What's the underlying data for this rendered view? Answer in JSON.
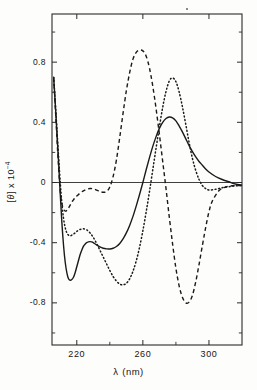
{
  "figure": {
    "kind": "scientific-plot",
    "background": "#fdfdfc",
    "ink": "#1a1a1a"
  },
  "axes": {
    "x": {
      "label_symbol": "λ",
      "label_unit": "(nm)",
      "label_full": "λ (nm)",
      "ticks": [
        220,
        260,
        300
      ],
      "tick_labels": [
        "220",
        "260",
        "300"
      ],
      "range": [
        205,
        320
      ],
      "minor_ticks": [
        240,
        280
      ]
    },
    "y": {
      "label_bracket_open": "[",
      "label_symbol": "θ",
      "label_bracket_close": "]",
      "label_mult": " x 10",
      "label_exp": "-4",
      "label_full": "[θ] x 10⁻⁴",
      "ticks": [
        0.8,
        0.4,
        0,
        -0.4,
        -0.8
      ],
      "tick_labels": [
        "0.8",
        "0.4",
        "0",
        "-0.4",
        "-0.8"
      ],
      "range": [
        -1.08,
        1.12
      ],
      "minor_ticks": [
        1.0,
        0.6,
        0.2,
        -0.2,
        -0.6,
        -1.0
      ]
    },
    "frame": {
      "left": 52,
      "right": 242,
      "top": 14,
      "bottom": 345
    },
    "zero_line": true
  },
  "chart_data": {
    "type": "line",
    "title": "",
    "xlabel": "λ (nm)",
    "ylabel": "[θ] x 10⁻⁴",
    "xlim": [
      205,
      320
    ],
    "ylim": [
      -1.08,
      1.12
    ],
    "grid": false,
    "legend": "none",
    "x_unit": "nm",
    "y_unit": "deg cm2 dmol-1 (x 10^-4)",
    "series": [
      {
        "name": "solid-curve",
        "style": "solid",
        "color": "#1a1a1a",
        "width": 1.4,
        "x": [
          206,
          207,
          208,
          209,
          210,
          211,
          212,
          213,
          214,
          215,
          216,
          217,
          218,
          219,
          220,
          221,
          222,
          223,
          224,
          225,
          226,
          227,
          228,
          229,
          230,
          232,
          234,
          236,
          238,
          240,
          242,
          244,
          246,
          248,
          250,
          252,
          254,
          256,
          258,
          260,
          262,
          264,
          266,
          268,
          270,
          272,
          274,
          276,
          278,
          280,
          282,
          284,
          286,
          288,
          290,
          292,
          294,
          296,
          298,
          300,
          304,
          308,
          312,
          316,
          320
        ],
        "y": [
          0.7,
          0.52,
          0.33,
          0.13,
          -0.08,
          -0.27,
          -0.42,
          -0.53,
          -0.6,
          -0.64,
          -0.65,
          -0.645,
          -0.63,
          -0.6,
          -0.56,
          -0.52,
          -0.48,
          -0.45,
          -0.425,
          -0.41,
          -0.4,
          -0.395,
          -0.393,
          -0.395,
          -0.4,
          -0.415,
          -0.428,
          -0.437,
          -0.441,
          -0.442,
          -0.437,
          -0.425,
          -0.405,
          -0.375,
          -0.335,
          -0.285,
          -0.225,
          -0.155,
          -0.08,
          0.0,
          0.085,
          0.165,
          0.24,
          0.305,
          0.36,
          0.4,
          0.425,
          0.435,
          0.43,
          0.41,
          0.375,
          0.335,
          0.29,
          0.245,
          0.205,
          0.17,
          0.14,
          0.115,
          0.09,
          0.07,
          0.04,
          0.02,
          0.005,
          -0.01,
          -0.018
        ]
      },
      {
        "name": "dashed-curve",
        "style": "dashed",
        "color": "#1a1a1a",
        "width": 1.4,
        "dash": "4,3",
        "x": [
          206,
          207,
          208,
          209,
          210,
          211,
          212,
          213,
          214,
          215,
          216,
          217,
          218,
          219,
          220,
          222,
          224,
          226,
          228,
          230,
          232,
          234,
          236,
          238,
          240,
          242,
          244,
          246,
          248,
          250,
          252,
          254,
          256,
          258,
          260,
          262,
          264,
          266,
          268,
          270,
          272,
          274,
          276,
          278,
          280,
          282,
          284,
          286,
          288,
          290,
          292,
          294,
          296,
          298,
          300,
          302,
          306,
          310,
          314,
          318,
          320
        ],
        "y": [
          0.7,
          0.5,
          0.29,
          0.1,
          -0.06,
          -0.14,
          -0.175,
          -0.19,
          -0.185,
          -0.17,
          -0.15,
          -0.13,
          -0.115,
          -0.1,
          -0.09,
          -0.07,
          -0.055,
          -0.045,
          -0.04,
          -0.042,
          -0.05,
          -0.06,
          -0.065,
          -0.06,
          -0.03,
          0.04,
          0.15,
          0.3,
          0.46,
          0.61,
          0.73,
          0.82,
          0.865,
          0.88,
          0.875,
          0.84,
          0.76,
          0.64,
          0.49,
          0.32,
          0.14,
          -0.04,
          -0.23,
          -0.41,
          -0.57,
          -0.69,
          -0.765,
          -0.8,
          -0.795,
          -0.75,
          -0.66,
          -0.545,
          -0.42,
          -0.3,
          -0.195,
          -0.125,
          -0.055,
          -0.03,
          -0.022,
          -0.02,
          -0.02
        ]
      },
      {
        "name": "dotted-curve",
        "style": "dotted",
        "color": "#1a1a1a",
        "width": 1.5,
        "dash": "1,2.6",
        "x": [
          206,
          207,
          208,
          209,
          210,
          211,
          212,
          213,
          214,
          215,
          216,
          217,
          218,
          219,
          220,
          222,
          224,
          226,
          228,
          230,
          232,
          234,
          236,
          238,
          240,
          242,
          244,
          246,
          248,
          250,
          252,
          254,
          256,
          258,
          260,
          262,
          264,
          266,
          268,
          270,
          272,
          274,
          276,
          278,
          280,
          282,
          284,
          286,
          288,
          290,
          292,
          294,
          296,
          298,
          300,
          304,
          308,
          312,
          316,
          320
        ],
        "y": [
          0.7,
          0.53,
          0.35,
          0.17,
          0.0,
          -0.14,
          -0.24,
          -0.3,
          -0.335,
          -0.35,
          -0.355,
          -0.35,
          -0.343,
          -0.335,
          -0.325,
          -0.312,
          -0.308,
          -0.315,
          -0.335,
          -0.365,
          -0.405,
          -0.45,
          -0.495,
          -0.54,
          -0.585,
          -0.625,
          -0.655,
          -0.675,
          -0.68,
          -0.67,
          -0.64,
          -0.59,
          -0.52,
          -0.43,
          -0.32,
          -0.195,
          -0.06,
          0.085,
          0.23,
          0.37,
          0.5,
          0.605,
          0.675,
          0.695,
          0.67,
          0.6,
          0.5,
          0.385,
          0.265,
          0.16,
          0.08,
          0.02,
          -0.02,
          -0.04,
          -0.05,
          -0.045,
          -0.035,
          -0.028,
          -0.022,
          -0.02
        ]
      }
    ],
    "annotations": {
      "solid_min": {
        "x": 216,
        "y": -0.65
      },
      "solid_shoulder_min": {
        "x": 240,
        "y": -0.442
      },
      "solid_local_max": {
        "x": 228,
        "y": -0.393
      },
      "solid_max": {
        "x": 276,
        "y": 0.435
      },
      "dashed_min_left": {
        "x": 213,
        "y": -0.19
      },
      "dashed_max": {
        "x": 258,
        "y": 0.88
      },
      "dashed_min_right": {
        "x": 286,
        "y": -0.8
      },
      "dotted_min_left": {
        "x": 216,
        "y": -0.355
      },
      "dotted_local_max": {
        "x": 224,
        "y": -0.308
      },
      "dotted_min": {
        "x": 248,
        "y": -0.68
      },
      "dotted_max": {
        "x": 278,
        "y": 0.695
      }
    }
  }
}
